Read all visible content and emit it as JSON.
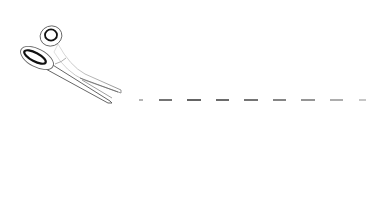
{
  "illustration": {
    "subject": "scissors cutting along dashed line on paper",
    "paper": {
      "x": 122,
      "y": 9,
      "width": 251,
      "height": 184,
      "border_color": "#3a3a3a",
      "fill": "#ffffff"
    },
    "cut_line": {
      "y": 100,
      "color": "#333333",
      "dashes": [
        {
          "x1": 139,
          "x2": 143,
          "opacity": 0.45
        },
        {
          "x1": 159,
          "x2": 172,
          "opacity": 0.85
        },
        {
          "x1": 187,
          "x2": 201,
          "opacity": 0.95
        },
        {
          "x1": 216,
          "x2": 229,
          "opacity": 0.9
        },
        {
          "x1": 244,
          "x2": 258,
          "opacity": 0.85
        },
        {
          "x1": 273,
          "x2": 286,
          "opacity": 0.75
        },
        {
          "x1": 301,
          "x2": 315,
          "opacity": 0.65
        },
        {
          "x1": 330,
          "x2": 343,
          "opacity": 0.5
        },
        {
          "x1": 359,
          "x2": 366,
          "opacity": 0.35
        }
      ]
    },
    "icons": {
      "scissors": "scissors-icon"
    }
  }
}
